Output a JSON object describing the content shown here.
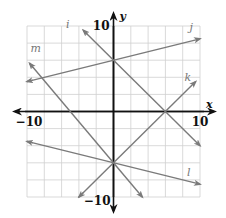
{
  "chart_data": {
    "type": "line",
    "title": "",
    "xlabel": "x",
    "ylabel": "y",
    "xlim": [
      -10,
      10
    ],
    "ylim": [
      -10,
      10
    ],
    "grid": true,
    "grid_step": 2,
    "tick_labels": {
      "x_min": "−10",
      "x_max": "10",
      "y_max": "10",
      "y_min": "−10"
    },
    "series": [
      {
        "name": "i",
        "equation": "y = -x + 6",
        "slope": -1,
        "intercept": 6,
        "x": [
          -3.5,
          10
        ],
        "y": [
          9.5,
          -4
        ],
        "label_pos": [
          -5.5,
          9.8
        ]
      },
      {
        "name": "j",
        "equation": "y = 0.25x + 6",
        "slope": 0.25,
        "intercept": 6,
        "x": [
          -10,
          10
        ],
        "y": [
          3.5,
          8.5
        ],
        "label_pos": [
          8.8,
          9.4
        ]
      },
      {
        "name": "k",
        "equation": "y = x - 6",
        "slope": 1,
        "intercept": -6,
        "x": [
          -4,
          9.5
        ],
        "y": [
          -10,
          3.5
        ],
        "label_pos": [
          8.2,
          3.6
        ]
      },
      {
        "name": "l",
        "equation": "y = -0.25x - 6",
        "slope": -0.25,
        "intercept": -6,
        "x": [
          -10,
          10
        ],
        "y": [
          -3.5,
          -8.5
        ],
        "label_pos": [
          8.5,
          -7.6
        ]
      },
      {
        "name": "m",
        "equation": "y = -1.2x - 6",
        "slope": -1.2,
        "intercept": -6,
        "x": [
          -9.7,
          3.33
        ],
        "y": [
          5.64,
          -10
        ],
        "label_pos": [
          -9.6,
          7.0
        ]
      }
    ],
    "colors": {
      "lines": "#7a7a7a",
      "axes": "#111111",
      "grid": "#cfcfcf"
    }
  }
}
